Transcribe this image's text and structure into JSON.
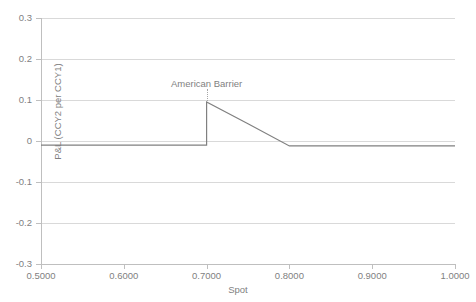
{
  "chart_data": {
    "type": "line",
    "title": "",
    "xlabel": "Spot",
    "ylabel": "P&L (CCY2 per CCY1)",
    "xlim": [
      0.5,
      1.0
    ],
    "ylim": [
      -0.3,
      0.3
    ],
    "grid": true,
    "legend": "none",
    "line_color": "#808080",
    "gridline_color": "#d9d9d9",
    "axis_color": "#bfbfbf",
    "background": "#ffffff",
    "xticks": [
      0.5,
      0.6,
      0.7,
      0.8,
      0.9,
      1.0
    ],
    "xtick_labels": [
      "0.5000",
      "0.6000",
      "0.7000",
      "0.8000",
      "0.9000",
      "1.0000"
    ],
    "yticks": [
      0.3,
      0.2,
      0.1,
      0,
      -0.1,
      -0.2,
      -0.3
    ],
    "ytick_labels": [
      "0.3",
      "0.2",
      "0.1",
      "0",
      "-0.1",
      "-0.2",
      "-0.3"
    ],
    "series": [
      {
        "name": "P&L",
        "x": [
          0.5,
          0.6,
          0.699,
          0.7,
          0.7,
          0.75,
          0.8,
          0.9,
          1.0
        ],
        "values": [
          -0.01,
          -0.01,
          -0.01,
          -0.01,
          0.095,
          0.042,
          -0.012,
          -0.012,
          -0.012
        ]
      }
    ],
    "annotations": [
      {
        "text": "American Barrier",
        "x": 0.7,
        "y": 0.14,
        "leader": true,
        "leader_to_y": 0.098
      }
    ]
  }
}
